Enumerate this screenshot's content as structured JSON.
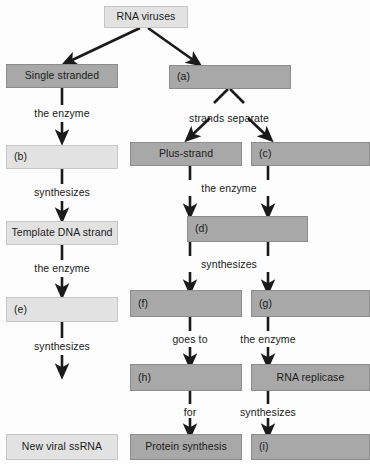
{
  "diagram": {
    "colors": {
      "dark_box": "#a8a8a8",
      "light_box": "#e2e2e2",
      "arrow": "#1a1a1a",
      "text": "#1a1a1a",
      "background": "#fdfdfd"
    },
    "nodes": {
      "rna_viruses": "RNA viruses",
      "single_stranded": "Single stranded",
      "a": "(a)",
      "b": "(b)",
      "plus_strand": "Plus-strand",
      "c": "(c)",
      "d": "(d)",
      "template_dna_strand": "Template DNA strand",
      "f": "(f)",
      "g": "(g)",
      "e": "(e)",
      "h": "(h)",
      "rna_replicase": "RNA replicase",
      "new_viral_ssrna": "New viral ssRNA",
      "protein_synthesis": "Protein synthesis",
      "i": "(i)"
    },
    "edge_labels": {
      "the_enzyme_left_1": "the enzyme",
      "strands_separate": "strands separate",
      "synthesizes_left_1": "synthesizes",
      "the_enzyme_mid_1": "the enzyme",
      "the_enzyme_left_2": "the enzyme",
      "synthesizes_mid_1": "synthesizes",
      "goes_to": "goes to",
      "the_enzyme_right_1": "the enzyme",
      "synthesizes_left_2": "synthesizes",
      "for": "for",
      "synthesizes_right_1": "synthesizes"
    }
  }
}
